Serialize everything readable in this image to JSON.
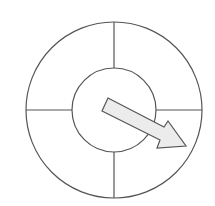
{
  "diagram": {
    "type": "spinner",
    "sections": 4,
    "stroke_color": "#555555",
    "arrow_fill": "#ececec",
    "arrow_direction": "lower-right",
    "section_labels": []
  }
}
